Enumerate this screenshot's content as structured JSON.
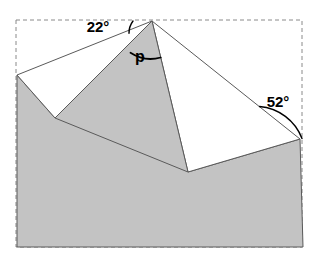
{
  "diagram": {
    "type": "geometry-angle-diagram",
    "canvas": {
      "width": 315,
      "height": 257,
      "background": "#ffffff"
    },
    "colors": {
      "shaded_fill": "#c3c3c3",
      "white_fill": "#ffffff",
      "outline": "#5a5a5a",
      "dashed_border": "#8a8a8a",
      "text": "#000000"
    },
    "bounding_box": {
      "name": "dashed-rectangle",
      "x": 16,
      "y": 20,
      "width": 286,
      "height": 227,
      "stroke_dasharray": "4 3"
    },
    "points": {
      "apex": {
        "x": 152,
        "y": 21,
        "label": "apex"
      },
      "left_edge_top": {
        "x": 17,
        "y": 75,
        "label": "left-slope-start"
      },
      "left_notch": {
        "x": 55,
        "y": 118,
        "label": "left-valley"
      },
      "right_notch": {
        "x": 188,
        "y": 172,
        "label": "right-valley"
      },
      "right_edge_top": {
        "x": 300,
        "y": 139,
        "label": "right-slope-end"
      },
      "bottom_right": {
        "x": 303,
        "y": 247,
        "label": "bottom-right-corner"
      },
      "bottom_left": {
        "x": 17,
        "y": 247,
        "label": "bottom-left-corner"
      }
    },
    "shapes": {
      "shaded_base": {
        "name": "shaded-base-polygon",
        "points": "17,75 55,118 152,21 188,172 300,139 303,247 17,247"
      },
      "left_white_triangle": {
        "name": "left-white-triangle",
        "points": "17,75 152,21 55,118"
      },
      "right_white_triangle": {
        "name": "right-white-triangle",
        "points": "152,21 300,139 188,172"
      },
      "gray_wedge": {
        "name": "center-gray-wedge",
        "points": "152,21 188,172 55,118"
      }
    },
    "angles": [
      {
        "id": "angle-22",
        "label": "22°",
        "value": 22,
        "unit": "degrees",
        "label_x": 98,
        "label_y": 32,
        "arc_path": "M 133 21 A 20 20 0 0 0 129.0 33.3",
        "description": "Angle between the dashed top edge and the left slope"
      },
      {
        "id": "angle-p",
        "label": "p",
        "value": null,
        "unit": "unknown",
        "label_x": 140,
        "label_y": 62,
        "arc_path": "M 130.5 52.8 A 37 37 0 0 0 160.7 57.5",
        "description": "Unknown angle at the apex between the two roof faces"
      },
      {
        "id": "angle-52",
        "label": "52°",
        "value": 52,
        "unit": "degrees",
        "label_x": 263,
        "label_y": 107,
        "arc_path": "M 259.5 106.5 A 50 50 0 0 1 302 138.5",
        "description": "Angle between the right slope and the dashed right edge"
      }
    ]
  },
  "chart_data": {
    "type": "diagram",
    "annotations": [
      "22°",
      "p",
      "52°"
    ],
    "known_angles": [
      22,
      52
    ],
    "unknown_angles": [
      "p"
    ]
  }
}
